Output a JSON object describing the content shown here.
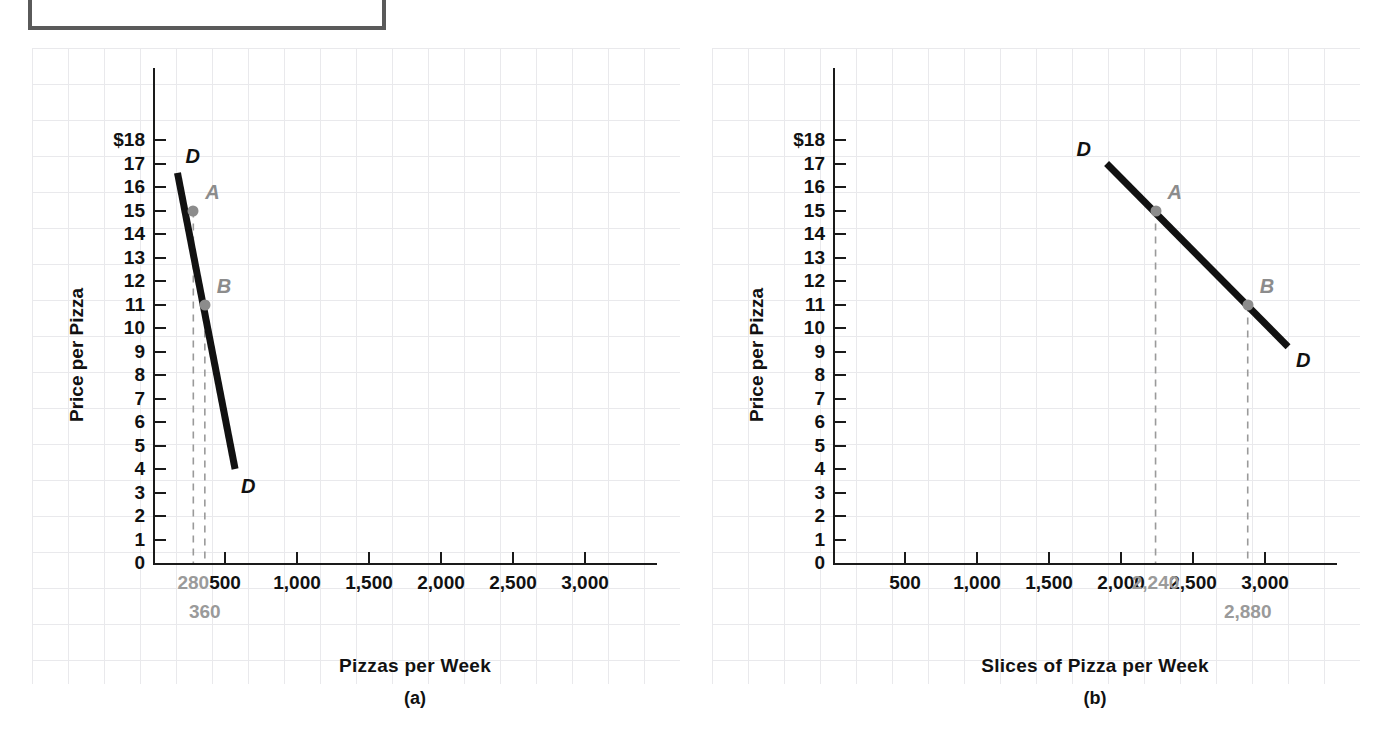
{
  "figure": {
    "top_box_label": ""
  },
  "chart_data": [
    {
      "type": "line",
      "panel": "a",
      "title": "",
      "xlabel": "Pizzas per Week",
      "ylabel": "Price per Pizza",
      "caption": "(a)",
      "xlim": [
        0,
        3500
      ],
      "ylim": [
        0,
        18
      ],
      "grid": true,
      "legend": "none",
      "x_ticks": [
        "500",
        "1,000",
        "1,500",
        "2,000",
        "2,500",
        "3,000"
      ],
      "x_tick_values": [
        500,
        1000,
        1500,
        2000,
        2500,
        3000
      ],
      "y_ticks": [
        "$18",
        "17",
        "16",
        "15",
        "14",
        "13",
        "12",
        "11",
        "10",
        "9",
        "8",
        "7",
        "6",
        "5",
        "4",
        "3",
        "2",
        "1",
        "0"
      ],
      "y_tick_values": [
        18,
        17,
        16,
        15,
        14,
        13,
        12,
        11,
        10,
        9,
        8,
        7,
        6,
        5,
        4,
        3,
        2,
        1,
        0
      ],
      "x_annotations": [
        "280",
        "360"
      ],
      "x_annotation_values": [
        280,
        360
      ],
      "series": [
        {
          "name": "D",
          "label_start": "D",
          "label_end": "D",
          "x": [
            170,
            570
          ],
          "y": [
            16.6,
            4.0
          ]
        }
      ],
      "points": [
        {
          "label": "A",
          "x": 280,
          "y": 15
        },
        {
          "label": "B",
          "x": 360,
          "y": 11
        }
      ]
    },
    {
      "type": "line",
      "panel": "b",
      "title": "",
      "xlabel": "Slices of Pizza per Week",
      "ylabel": "Price per Pizza",
      "caption": "(b)",
      "xlim": [
        0,
        3500
      ],
      "ylim": [
        0,
        18
      ],
      "grid": true,
      "legend": "none",
      "x_ticks": [
        "500",
        "1,000",
        "1,500",
        "2,000",
        "2,500",
        "3,000"
      ],
      "x_tick_values": [
        500,
        1000,
        1500,
        2000,
        2500,
        3000
      ],
      "y_ticks": [
        "$18",
        "17",
        "16",
        "15",
        "14",
        "13",
        "12",
        "11",
        "10",
        "9",
        "8",
        "7",
        "6",
        "5",
        "4",
        "3",
        "2",
        "1",
        "0"
      ],
      "y_tick_values": [
        18,
        17,
        16,
        15,
        14,
        13,
        12,
        11,
        10,
        9,
        8,
        7,
        6,
        5,
        4,
        3,
        2,
        1,
        0
      ],
      "x_annotations": [
        "2,240",
        "2,880"
      ],
      "x_annotation_values": [
        2240,
        2880
      ],
      "series": [
        {
          "name": "D",
          "label_start": "D",
          "label_end": "D",
          "x": [
            1900,
            3160
          ],
          "y": [
            17.0,
            9.2
          ]
        }
      ],
      "points": [
        {
          "label": "A",
          "x": 2240,
          "y": 15
        },
        {
          "label": "B",
          "x": 2880,
          "y": 11
        }
      ]
    }
  ]
}
